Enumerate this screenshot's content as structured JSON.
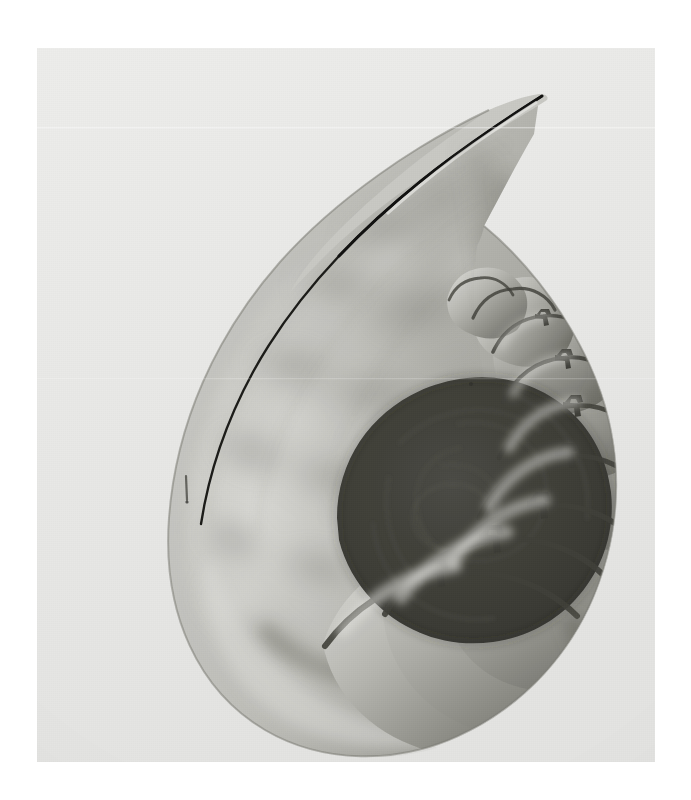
{
  "image": {
    "kind": "photograph",
    "medium": "black-and-white gelatin silver print",
    "subject": "Chambered nautilus shell sectioned along its midline",
    "orientation": "portrait",
    "caption": "Nautilus shell cross-section",
    "alt_text": "A black and white photograph of a nautilus shell cut in half lengthwise, showing the large outer body chamber curving up to a pointed aperture at the upper right and a logarithmic spiral of progressively smaller gas chambers separated by curved septa, each pierced by a small siphuncle tube, coiling into a dark core at the lower right.",
    "canvas": {
      "width": 691,
      "height": 800,
      "background_color": "#ffffff"
    },
    "print": {
      "left": 37,
      "top": 48,
      "width": 618,
      "height": 714,
      "paper_color": "#e9e9e7"
    }
  },
  "palette": {
    "page_white": "#ffffff",
    "paper_light": "#ececeb",
    "paper_mid": "#e3e3e1",
    "shell_highlight": "#d9d9d6",
    "shell_light": "#c2c2bd",
    "shell_mid": "#9e9e99",
    "shell_shadow": "#77776f",
    "shell_dark": "#55554f",
    "core_dark": "#3c3c38",
    "outline_black": "#1d1d1a",
    "septum_line": "#4a4a44"
  },
  "anatomy": {
    "body_chamber": {
      "label": "Body chamber",
      "description": "Large smooth outer living chamber sweeping from lower left up and over to the right"
    },
    "aperture": {
      "label": "Aperture rim",
      "description": "Thin tapered shell lip at the upper right ending in a fine point"
    },
    "protoconch": {
      "label": "Dark core",
      "description": "Innermost coiled chambers rendered almost black"
    },
    "septa": {
      "label": "Septa",
      "count": 9,
      "description": "Curved calcareous walls dividing the phragmocone into gas chambers"
    },
    "siphuncle": {
      "label": "Siphuncle",
      "count": 7,
      "description": "Small dark tube piercing the centre of each septum"
    },
    "growth_bands": {
      "label": "Growth bands",
      "description": "Soft tonal flame-banding mottling the outer wall of the body chamber"
    },
    "blemish": {
      "label": "Emulsion scratch",
      "x": 186,
      "y": 487,
      "description": "Small dark vertical scratch on the print"
    }
  },
  "chambers": [
    {
      "index": 1,
      "label": "chamber-1",
      "note": "largest phragmocone chamber, lower centre"
    },
    {
      "index": 2,
      "label": "chamber-2",
      "note": "lower centre-right"
    },
    {
      "index": 3,
      "label": "chamber-3",
      "note": "bottom right"
    },
    {
      "index": 4,
      "label": "chamber-4",
      "note": "right flank lower"
    },
    {
      "index": 5,
      "label": "chamber-5",
      "note": "right flank middle"
    },
    {
      "index": 6,
      "label": "chamber-6",
      "note": "right flank upper"
    },
    {
      "index": 7,
      "label": "chamber-7",
      "note": "upper right of coil"
    },
    {
      "index": 8,
      "label": "chamber-8",
      "note": "small, near core"
    },
    {
      "index": 9,
      "label": "chamber-9",
      "note": "smallest visible, adjacent to core"
    }
  ]
}
